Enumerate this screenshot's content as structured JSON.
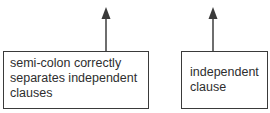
{
  "diagram": {
    "annotations": [
      {
        "id": "left",
        "lines": [
          "semi-colon correctly",
          "separates independent",
          "clauses"
        ],
        "arrow_direction": "up"
      },
      {
        "id": "right",
        "lines": [
          "independent",
          "clause"
        ],
        "arrow_direction": "up"
      }
    ],
    "colors": {
      "stroke": "#3a3a3a",
      "text": "#2e2e2e",
      "background": "#ffffff"
    }
  }
}
